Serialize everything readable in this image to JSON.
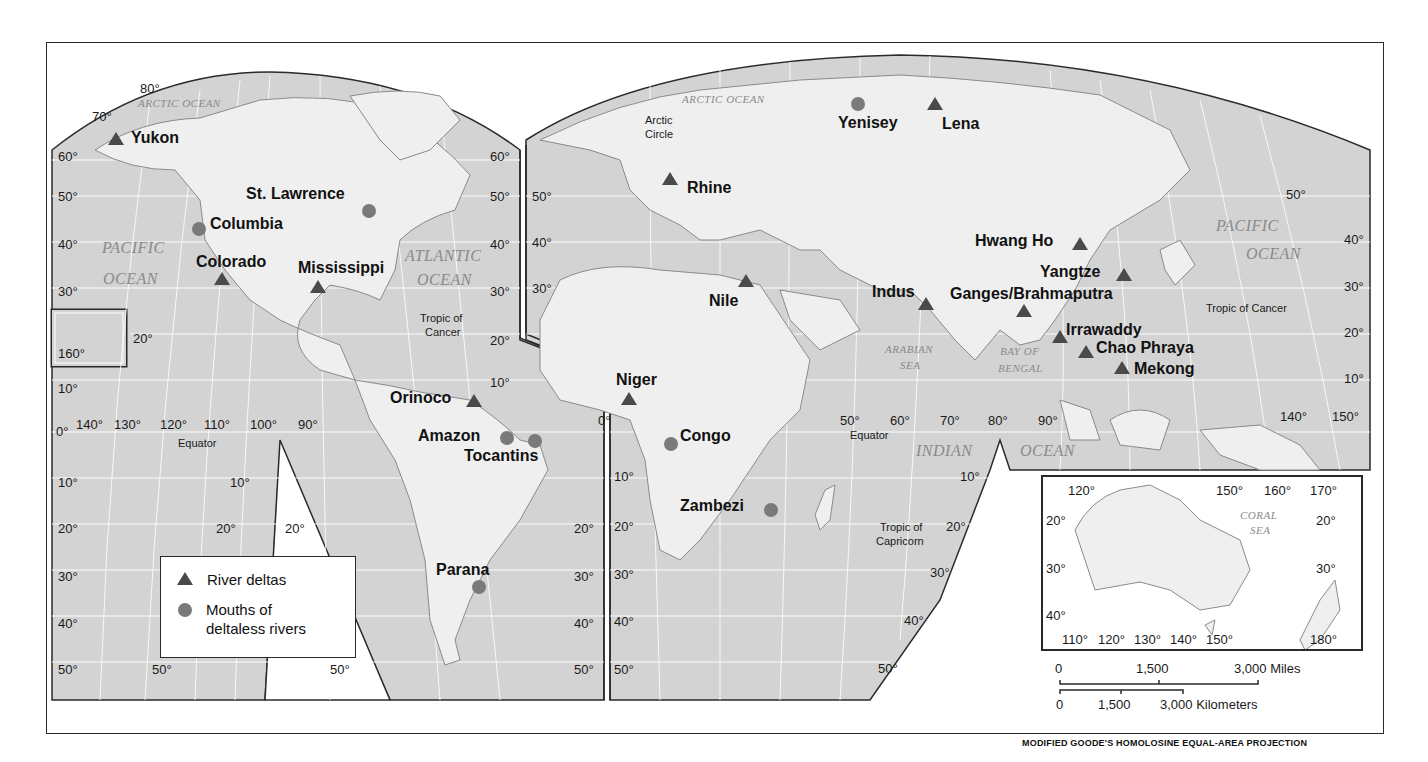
{
  "map": {
    "projection_note": "MODIFIED GOODE'S HOMOLOSINE EQUAL-AREA PROJECTION",
    "colors": {
      "ocean": "#d3d3d3",
      "land": "#efefef",
      "gridline": "#ffffff",
      "delta_marker": "#4a4a4a",
      "deltaless_marker": "#7a7a7a",
      "border": "#2a2a2a",
      "ocean_label": "#8a8a8a"
    },
    "legend": {
      "items": [
        {
          "symbol": "triangle",
          "label": "River deltas"
        },
        {
          "symbol": "circle",
          "label_line1": "Mouths of",
          "label_line2": "deltaless rivers"
        }
      ]
    },
    "rivers": [
      {
        "name": "Yukon",
        "type": "delta"
      },
      {
        "name": "St. Lawrence",
        "type": "deltaless"
      },
      {
        "name": "Columbia",
        "type": "deltaless"
      },
      {
        "name": "Colorado",
        "type": "delta"
      },
      {
        "name": "Mississippi",
        "type": "delta"
      },
      {
        "name": "Orinoco",
        "type": "delta"
      },
      {
        "name": "Amazon",
        "type": "deltaless"
      },
      {
        "name": "Tocantins",
        "type": "deltaless"
      },
      {
        "name": "Parana",
        "type": "deltaless"
      },
      {
        "name": "Rhine",
        "type": "delta"
      },
      {
        "name": "Yenisey",
        "type": "deltaless"
      },
      {
        "name": "Lena",
        "type": "delta"
      },
      {
        "name": "Nile",
        "type": "delta"
      },
      {
        "name": "Niger",
        "type": "delta"
      },
      {
        "name": "Congo",
        "type": "deltaless"
      },
      {
        "name": "Zambezi",
        "type": "deltaless"
      },
      {
        "name": "Indus",
        "type": "delta"
      },
      {
        "name": "Ganges/Brahmaputra",
        "type": "delta"
      },
      {
        "name": "Hwang Ho",
        "type": "delta"
      },
      {
        "name": "Yangtze",
        "type": "delta"
      },
      {
        "name": "Irrawaddy",
        "type": "delta"
      },
      {
        "name": "Chao Phraya",
        "type": "delta"
      },
      {
        "name": "Mekong",
        "type": "delta"
      }
    ],
    "oceans": {
      "arctic_west": "ARCTIC OCEAN",
      "arctic_east": "ARCTIC OCEAN",
      "pacific_east_1": "PACIFIC",
      "pacific_east_2": "OCEAN",
      "atlantic_1": "ATLANTIC",
      "atlantic_2": "OCEAN",
      "pacific_west_1": "PACIFIC",
      "pacific_west_2": "OCEAN",
      "arabian_1": "ARABIAN",
      "arabian_2": "SEA",
      "bengal_1": "BAY OF",
      "bengal_2": "BENGAL",
      "indian_1": "INDIAN",
      "indian_2": "OCEAN",
      "coral_1": "CORAL",
      "coral_2": "SEA"
    },
    "lines": {
      "arctic_circle_1": "Arctic",
      "arctic_circle_2": "Circle",
      "tropic_cancer_w1": "Tropic of",
      "tropic_cancer_w2": "Cancer",
      "tropic_cancer_e": "Tropic of Cancer",
      "equator_w": "Equator",
      "equator_e": "Equator",
      "tropic_capricorn_1": "Tropic of",
      "tropic_capricorn_2": "Capricorn"
    },
    "degrees": {
      "d80": "80°",
      "d70": "70°",
      "d60": "60°",
      "d50": "50°",
      "d40": "40°",
      "d30": "30°",
      "d20": "20°",
      "d10": "10°",
      "d0": "0°",
      "d90": "90°",
      "d100": "100°",
      "d110": "110°",
      "d120": "120°",
      "d130": "130°",
      "d140": "140°",
      "d150": "150°",
      "d160": "160°",
      "d170": "170°",
      "d180": "180°"
    },
    "scale": {
      "miles_0": "0",
      "miles_1500": "1,500",
      "miles_3000": "3,000 Miles",
      "km_0": "0",
      "km_1500": "1,500",
      "km_3000": "3,000 Kilometers"
    }
  }
}
